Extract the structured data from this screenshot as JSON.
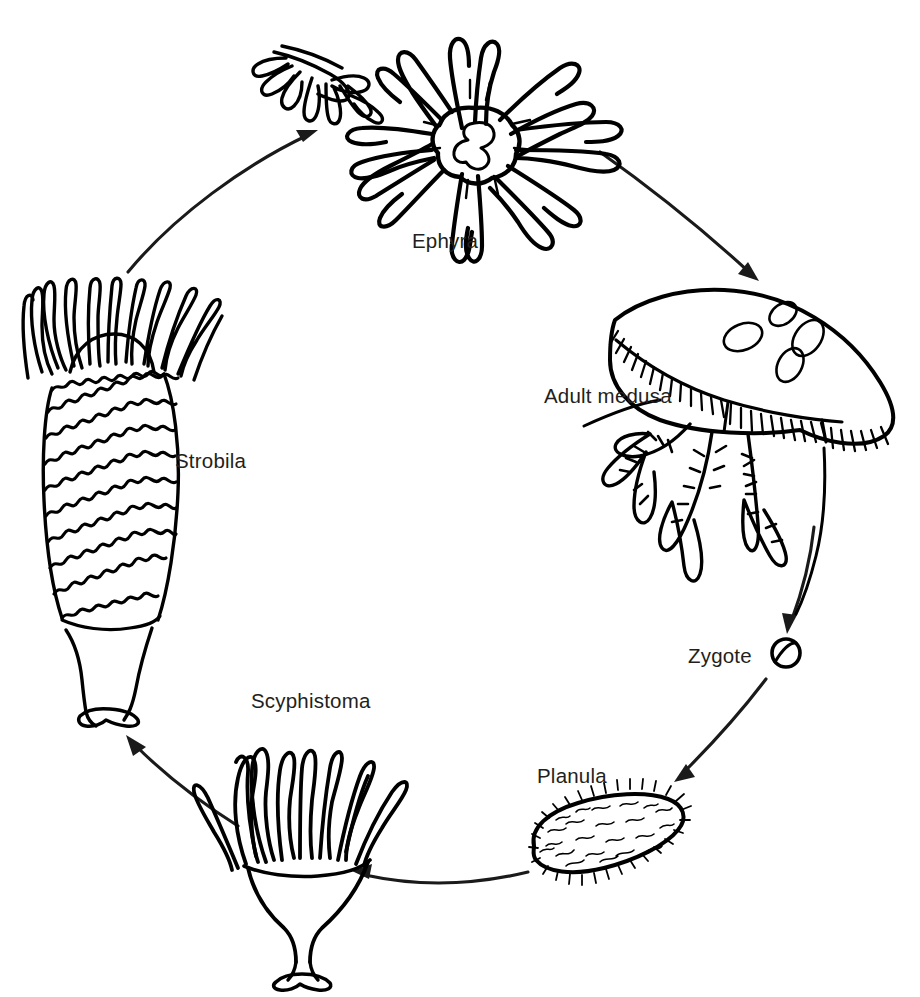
{
  "diagram": {
    "background_color": "#ffffff",
    "ink_color": "#000000",
    "label_color": "#231f20",
    "canvas": {
      "width": 920,
      "height": 997
    },
    "cycle_direction": "counterclockwise"
  },
  "labels": {
    "ephyra": "Ephyra",
    "adult_medusa": "Adult medusa",
    "zygote": "Zygote",
    "planula": "Planula",
    "scyphistoma": "Scyphistoma",
    "strobila": "Strobila"
  },
  "stages": [
    {
      "id": "ephyra",
      "label": "Ephyra",
      "label_x": 412,
      "label_y": 248,
      "figure_center": [
        475,
        140
      ],
      "description": "Free-swimming star-shaped juvenile with eight bifurcated lappet arms and a central manubrium; a second smaller detached ephyra is drawn to its upper left"
    },
    {
      "id": "adult-medusa",
      "label": "Adult medusa",
      "label_x": 544,
      "label_y": 403,
      "figure_center": [
        750,
        420
      ],
      "description": "Bell-shaped adult with four oval gonads on the exumbrella, fringed marginal tentacles and branched oral arms"
    },
    {
      "id": "zygote",
      "label": "Zygote",
      "label_x": 688,
      "label_y": 663,
      "figure_center": [
        786,
        653
      ],
      "description": "Small round fertilised egg with a diagonal cleavage line"
    },
    {
      "id": "planula",
      "label": "Planula",
      "label_x": 537,
      "label_y": 783,
      "figure_center": [
        604,
        835
      ],
      "description": "Ovoid ciliated swimming larva covered in fine cilia"
    },
    {
      "id": "scyphistoma",
      "label": "Scyphistoma",
      "label_x": 251,
      "label_y": 708,
      "figure_center": [
        300,
        845
      ],
      "description": "Sessile polyp with a crown of long tentacles on a narrow stalk anchored by a basal disc"
    },
    {
      "id": "strobila",
      "label": "Strobila",
      "label_x": 175,
      "label_y": 468,
      "figure_center": [
        112,
        500
      ],
      "description": "Segmented polyp stack of developing ephyra discs with tentacles at the top and a stalk below"
    }
  ],
  "arrows": [
    {
      "id": "strobila-to-ephyra",
      "from": "strobila",
      "to": "ephyra",
      "direction": "up-right"
    },
    {
      "id": "ephyra-to-adult-medusa",
      "from": "ephyra",
      "to": "adult-medusa",
      "direction": "down-right"
    },
    {
      "id": "adult-medusa-to-zygote",
      "from": "adult-medusa",
      "to": "zygote",
      "direction": "down"
    },
    {
      "id": "zygote-to-planula",
      "from": "zygote",
      "to": "planula",
      "direction": "down-left"
    },
    {
      "id": "planula-to-scyphistoma",
      "from": "planula",
      "to": "scyphistoma",
      "direction": "left"
    },
    {
      "id": "scyphistoma-to-strobila",
      "from": "scyphistoma",
      "to": "strobila",
      "direction": "up-left"
    }
  ]
}
